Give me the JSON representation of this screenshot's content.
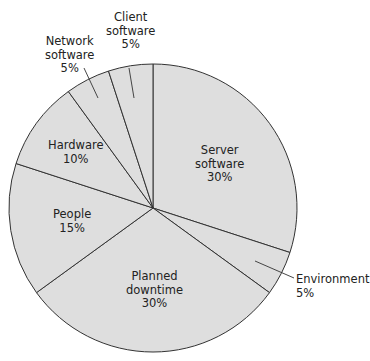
{
  "chart_data": {
    "type": "pie",
    "title": "",
    "start_angle_deg": 0,
    "direction": "clockwise",
    "slices": [
      {
        "label": "Server software",
        "value": 30
      },
      {
        "label": "Environment",
        "value": 5
      },
      {
        "label": "Planned downtime",
        "value": 30
      },
      {
        "label": "People",
        "value": 15
      },
      {
        "label": "Hardware",
        "value": 10
      },
      {
        "label": "Network software",
        "value": 5
      },
      {
        "label": "Client software",
        "value": 5
      }
    ],
    "unit": "%"
  },
  "labels": {
    "server": {
      "l1": "Server",
      "l2": "software",
      "pct": "30%"
    },
    "environment": {
      "l1": "Environment",
      "pct": "5%"
    },
    "planned": {
      "l1": "Planned",
      "l2": "downtime",
      "pct": "30%"
    },
    "people": {
      "l1": "People",
      "pct": "15%"
    },
    "hardware": {
      "l1": "Hardware",
      "pct": "10%"
    },
    "network": {
      "l1": "Network",
      "l2": "software",
      "pct": "5%"
    },
    "client": {
      "l1": "Client",
      "l2": "software",
      "pct": "5%"
    }
  },
  "style": {
    "fill": "#dedede",
    "stroke": "#333333"
  }
}
